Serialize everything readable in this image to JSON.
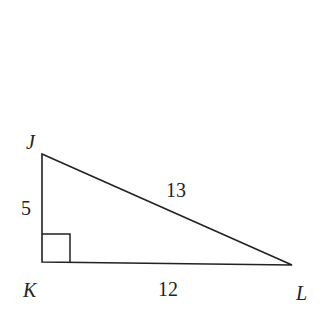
{
  "diagram": {
    "type": "right-triangle",
    "vertices": {
      "J": {
        "label": "J"
      },
      "K": {
        "label": "K"
      },
      "L": {
        "label": "L"
      }
    },
    "sides": {
      "JK": {
        "label": "5"
      },
      "KL": {
        "label": "12"
      },
      "JL": {
        "label": "13"
      }
    },
    "right_angle_at": "K",
    "stroke_color": "#222222"
  }
}
